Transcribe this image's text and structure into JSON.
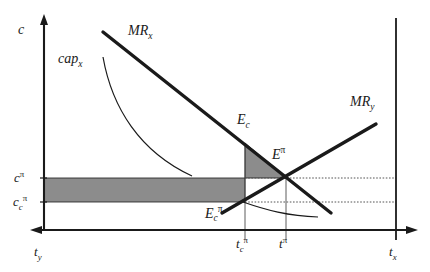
{
  "figure": {
    "type": "economics-line-diagram",
    "background_color": "#ffffff",
    "line_color": "#1a1a1a",
    "shade_color": "#8c8c8c",
    "axes": {
      "left_vertical_label": "c",
      "left_bottom_label_base": "t",
      "left_bottom_label_sub": "y",
      "right_bottom_label_base": "t",
      "right_bottom_label_sub": "x"
    },
    "curves": [
      {
        "name": "MR_x",
        "label_base": "MR",
        "label_sub": "x",
        "style": "thick-line",
        "slope": "negative"
      },
      {
        "name": "MR_y",
        "label_base": "MR",
        "label_sub": "y",
        "style": "thick-line",
        "slope": "positive"
      },
      {
        "name": "cap_x",
        "label_base": "cap",
        "label_sub": "x",
        "style": "thin-curve",
        "slope": "convex-decreasing"
      },
      {
        "name": "cap_y",
        "label_base": "",
        "label_sub": "",
        "style": "thin-curve",
        "slope": "shallow-decreasing"
      }
    ],
    "points": [
      {
        "name": "E_c",
        "label_base": "E",
        "label_sub": "c",
        "label_sup": ""
      },
      {
        "name": "E_pi",
        "label_base": "E",
        "label_sub": "",
        "label_sup": "π"
      },
      {
        "name": "E_c_pi",
        "label_base": "E",
        "label_sub": "c",
        "label_sup": "π"
      }
    ],
    "y_ticks": [
      {
        "name": "c_pi",
        "base": "c",
        "sup": "π",
        "sub": ""
      },
      {
        "name": "c_c_pi",
        "base": "c",
        "sup": "π",
        "sub": "c"
      }
    ],
    "x_ticks": [
      {
        "name": "t_c_pi",
        "base": "t",
        "sup": "π",
        "sub": "c"
      },
      {
        "name": "t_pi",
        "base": "t",
        "sup": "π",
        "sub": ""
      }
    ],
    "shaded_regions": [
      {
        "name": "rectangle-cost-saving",
        "shape": "rectangle"
      },
      {
        "name": "triangle-efficiency-loss",
        "shape": "triangle"
      }
    ]
  }
}
